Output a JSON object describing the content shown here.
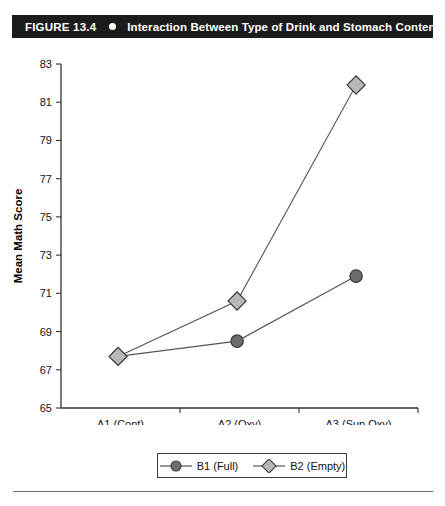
{
  "figure": {
    "number": "FIGURE 13.4",
    "bullet_icon": "filled-circle-icon",
    "title": "Interaction Between Type of Drink and Stomach Content",
    "header_bg": "#1c1c1c",
    "header_fg": "#ffffff"
  },
  "chart_data": {
    "type": "line",
    "title": "Interaction Between Type of Drink and Stomach Content",
    "xlabel": "Type of Drink",
    "ylabel": "Mean Math Score",
    "categories": [
      "A1 (Cont)",
      "A2 (Oxy)",
      "A3 (Sup Oxy)"
    ],
    "series": [
      {
        "name": "B1 (Full)",
        "values": [
          67.7,
          68.5,
          71.9
        ],
        "marker": "circle",
        "marker_fill": "#6e6e6e",
        "marker_stroke": "#3a3a3a",
        "line_color": "#555555"
      },
      {
        "name": "B2 (Empty)",
        "values": [
          67.7,
          70.6,
          81.9
        ],
        "marker": "diamond",
        "marker_fill": "#b8b8b8",
        "marker_stroke": "#3a3a3a",
        "line_color": "#555555"
      }
    ],
    "ylim": [
      65,
      83
    ],
    "yticks": [
      65,
      67,
      69,
      71,
      73,
      75,
      77,
      79,
      81,
      83
    ],
    "ytick_labels": [
      "65",
      "67",
      "69",
      "71",
      "73",
      "75",
      "77",
      "79",
      "81",
      "83"
    ],
    "grid": false,
    "legend_position": "bottom"
  },
  "legend": {
    "entries": [
      {
        "label": "B1 (Full)",
        "marker": "circle-marker-icon"
      },
      {
        "label": "B2 (Empty)",
        "marker": "diamond-marker-icon"
      }
    ]
  }
}
